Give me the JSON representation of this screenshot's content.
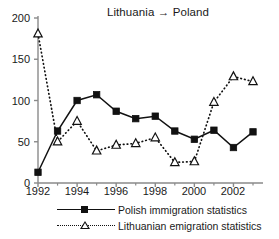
{
  "chart_data": {
    "type": "line",
    "title": "Lithuania → Poland",
    "xlabel": "",
    "ylabel": "",
    "xlim": [
      1992,
      2003
    ],
    "ylim": [
      0,
      200
    ],
    "ytick_labels": [
      "0",
      "50",
      "100",
      "150",
      "200"
    ],
    "ytick_values": [
      0,
      50,
      100,
      150,
      200
    ],
    "xtick_labels": [
      "1992",
      "1994",
      "1996",
      "1998",
      "2000",
      "2002"
    ],
    "xtick_values": [
      1992,
      1994,
      1996,
      1998,
      2000,
      2002
    ],
    "x_minor_ticks": [
      1993,
      1995,
      1997,
      1999,
      2001,
      2003
    ],
    "grid": false,
    "legend_position": "bottom",
    "x": [
      1992,
      1993,
      1994,
      1995,
      1996,
      1997,
      1998,
      1999,
      2000,
      2001,
      2002,
      2003
    ],
    "series": [
      {
        "name": "Polish immigration statistics",
        "marker": "filled-square",
        "line_style": "solid",
        "color": "#111111",
        "values": [
          13,
          63,
          100,
          107,
          87,
          78,
          81,
          63,
          53,
          64,
          43,
          62
        ]
      },
      {
        "name": "Lithuanian emigration statistics",
        "marker": "open-triangle",
        "line_style": "dotted",
        "color": "#111111",
        "values": [
          181,
          50,
          75,
          39,
          46,
          48,
          55,
          25,
          26,
          98,
          129,
          123
        ]
      }
    ]
  },
  "legend": {
    "items": [
      {
        "label": "Polish immigration statistics",
        "marker": "filled-square",
        "line_style": "solid"
      },
      {
        "label": "Lithuanian emigration statistics",
        "marker": "open-triangle",
        "line_style": "dotted"
      }
    ]
  }
}
